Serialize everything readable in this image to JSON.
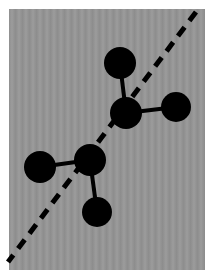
{
  "caption": {
    "text": "",
    "note": "partially cropped caption at top edge, illegible"
  },
  "figure": {
    "background_color": "#959595",
    "ink_color": "#000000",
    "mirror_line": {
      "style": "dashed",
      "from": [
        196,
        12
      ],
      "to": [
        8,
        262
      ]
    },
    "molecules": [
      {
        "name": "upper-right-molecule",
        "atoms": [
          {
            "cx": 120,
            "cy": 63,
            "r": 16
          },
          {
            "cx": 126,
            "cy": 113,
            "r": 16
          },
          {
            "cx": 176,
            "cy": 107,
            "r": 15
          }
        ],
        "bonds": [
          [
            0,
            1
          ],
          [
            1,
            2
          ]
        ]
      },
      {
        "name": "lower-left-molecule",
        "atoms": [
          {
            "cx": 40,
            "cy": 167,
            "r": 16
          },
          {
            "cx": 90,
            "cy": 160,
            "r": 16
          },
          {
            "cx": 97,
            "cy": 212,
            "r": 15
          }
        ],
        "bonds": [
          [
            0,
            1
          ],
          [
            1,
            2
          ]
        ]
      }
    ]
  }
}
